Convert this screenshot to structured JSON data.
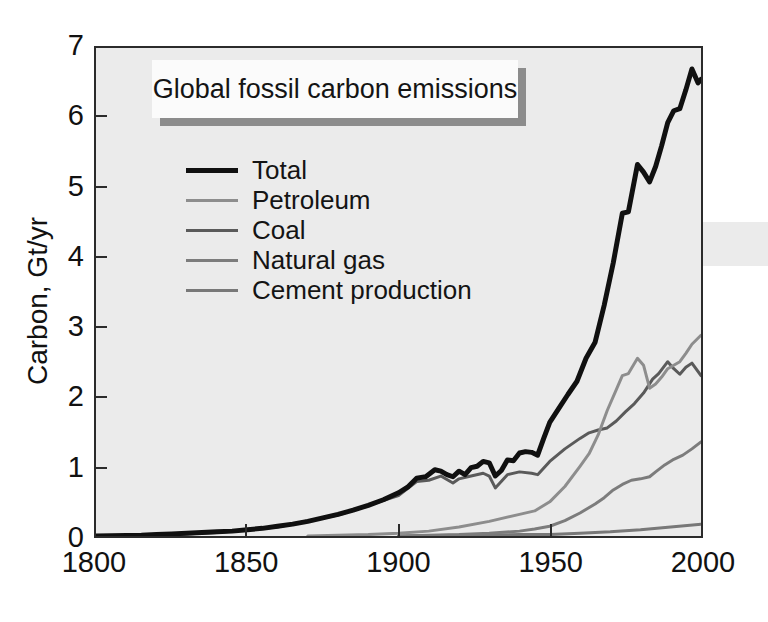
{
  "chart_data": {
    "type": "line",
    "title": "Global fossil carbon emissions",
    "xlabel": "",
    "ylabel": "Carbon, Gt/yr",
    "xlim": [
      1800,
      2000
    ],
    "ylim": [
      0,
      7
    ],
    "xticks": [
      "1800",
      "1850",
      "1900",
      "1950",
      "2000"
    ],
    "xtick_values": [
      1800,
      1850,
      1900,
      1950,
      2000
    ],
    "yticks": [
      "0",
      "1",
      "2",
      "3",
      "4",
      "5",
      "6",
      "7"
    ],
    "ytick_values": [
      0,
      1,
      2,
      3,
      4,
      5,
      6,
      7
    ],
    "grid": false,
    "legend_position": "upper-left",
    "series": [
      {
        "name": "Total",
        "color": "#101010",
        "width": 5,
        "x": [
          1800,
          1815,
          1820,
          1825,
          1830,
          1835,
          1840,
          1845,
          1850,
          1855,
          1860,
          1865,
          1870,
          1875,
          1880,
          1885,
          1890,
          1895,
          1900,
          1903,
          1906,
          1909,
          1912,
          1914,
          1916,
          1918,
          1920,
          1922,
          1924,
          1926,
          1928,
          1930,
          1932,
          1934,
          1936,
          1938,
          1940,
          1942,
          1944,
          1946,
          1948,
          1950,
          1953,
          1956,
          1959,
          1962,
          1965,
          1968,
          1971,
          1974,
          1976,
          1979,
          1981,
          1983,
          1985,
          1987,
          1989,
          1991,
          1993,
          1995,
          1997,
          1999,
          2000
        ],
        "y": [
          0.0,
          0.01,
          0.02,
          0.03,
          0.04,
          0.05,
          0.06,
          0.07,
          0.09,
          0.11,
          0.14,
          0.17,
          0.21,
          0.26,
          0.31,
          0.37,
          0.44,
          0.52,
          0.62,
          0.7,
          0.83,
          0.85,
          0.95,
          0.93,
          0.88,
          0.85,
          0.93,
          0.88,
          0.98,
          1.0,
          1.07,
          1.05,
          0.86,
          0.94,
          1.09,
          1.08,
          1.19,
          1.21,
          1.2,
          1.16,
          1.4,
          1.63,
          1.83,
          2.03,
          2.22,
          2.55,
          2.78,
          3.31,
          3.92,
          4.63,
          4.65,
          5.33,
          5.22,
          5.08,
          5.3,
          5.6,
          5.93,
          6.1,
          6.13,
          6.4,
          6.7,
          6.5,
          6.55
        ]
      },
      {
        "name": "Petroleum",
        "color": "#8d8d8d",
        "width": 3,
        "x": [
          1870,
          1880,
          1890,
          1900,
          1910,
          1920,
          1930,
          1940,
          1945,
          1950,
          1955,
          1960,
          1963,
          1966,
          1969,
          1972,
          1974,
          1976,
          1979,
          1981,
          1983,
          1985,
          1987,
          1989,
          1991,
          1993,
          1995,
          1997,
          2000
        ],
        "y": [
          0.0,
          0.01,
          0.02,
          0.04,
          0.07,
          0.13,
          0.21,
          0.31,
          0.36,
          0.49,
          0.71,
          1.0,
          1.18,
          1.45,
          1.8,
          2.1,
          2.3,
          2.33,
          2.55,
          2.45,
          2.12,
          2.18,
          2.28,
          2.4,
          2.45,
          2.5,
          2.62,
          2.75,
          2.88
        ]
      },
      {
        "name": "Coal",
        "color": "#5a5a5a",
        "width": 3,
        "x": [
          1820,
          1840,
          1860,
          1880,
          1900,
          1906,
          1910,
          1914,
          1918,
          1920,
          1924,
          1928,
          1930,
          1932,
          1936,
          1940,
          1944,
          1946,
          1950,
          1955,
          1960,
          1963,
          1966,
          1969,
          1972,
          1975,
          1978,
          1981,
          1984,
          1986,
          1989,
          1991,
          1993,
          1995,
          1997,
          2000
        ],
        "y": [
          0.01,
          0.05,
          0.13,
          0.3,
          0.58,
          0.78,
          0.8,
          0.86,
          0.76,
          0.82,
          0.86,
          0.9,
          0.86,
          0.69,
          0.88,
          0.92,
          0.9,
          0.88,
          1.07,
          1.25,
          1.4,
          1.48,
          1.52,
          1.55,
          1.65,
          1.78,
          1.9,
          2.05,
          2.25,
          2.33,
          2.5,
          2.4,
          2.32,
          2.42,
          2.48,
          2.3
        ]
      },
      {
        "name": "Natural gas",
        "color": "#7c7c7c",
        "width": 3,
        "x": [
          1900,
          1910,
          1920,
          1930,
          1940,
          1945,
          1950,
          1955,
          1960,
          1965,
          1968,
          1971,
          1974,
          1977,
          1980,
          1983,
          1985,
          1988,
          1991,
          1994,
          1997,
          2000
        ],
        "y": [
          0.0,
          0.01,
          0.02,
          0.04,
          0.07,
          0.1,
          0.14,
          0.22,
          0.33,
          0.46,
          0.55,
          0.66,
          0.74,
          0.8,
          0.82,
          0.85,
          0.92,
          1.02,
          1.1,
          1.16,
          1.25,
          1.35
        ]
      },
      {
        "name": "Cement production",
        "color": "#787878",
        "width": 3,
        "x": [
          1900,
          1920,
          1940,
          1950,
          1960,
          1970,
          1980,
          1990,
          2000
        ],
        "y": [
          0.0,
          0.01,
          0.02,
          0.02,
          0.04,
          0.06,
          0.09,
          0.13,
          0.17
        ]
      }
    ]
  }
}
